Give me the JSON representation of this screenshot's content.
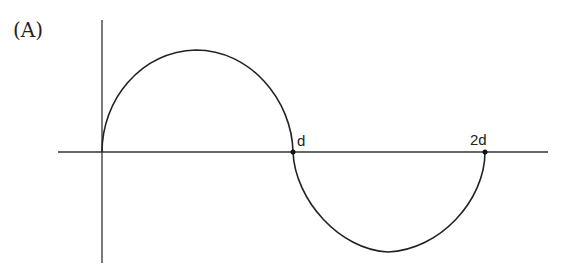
{
  "figure": {
    "label": "(A)",
    "points": [
      {
        "name": "d",
        "label": "d"
      },
      {
        "name": "2d",
        "label": "2d"
      }
    ]
  },
  "colors": {
    "stroke": "#222222",
    "background": "#ffffff"
  }
}
